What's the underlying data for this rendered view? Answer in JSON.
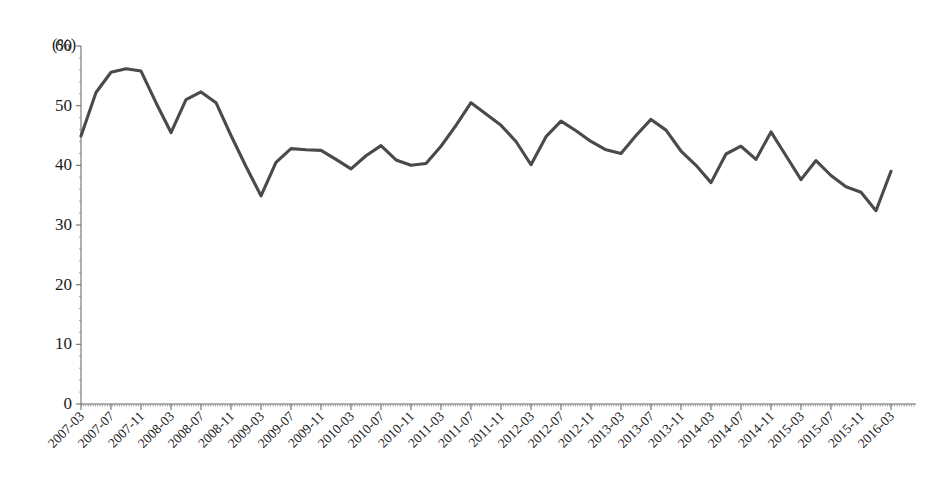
{
  "chart_data": {
    "type": "line",
    "title": "",
    "subtitle": "",
    "xlabel": "",
    "ylabel": "",
    "unit_label": "(%)",
    "grid": false,
    "legend": "none",
    "ylim": [
      0,
      60
    ],
    "ytick_values": [
      0,
      10,
      20,
      30,
      40,
      50,
      60
    ],
    "ytick_labels": [
      "0",
      "10",
      "20",
      "30",
      "40",
      "50",
      "60"
    ],
    "xtick_labels": [
      "2007-03",
      "2007-07",
      "2007-11",
      "2008-03",
      "2008-07",
      "2008-11",
      "2009-03",
      "2009-07",
      "2009-11",
      "2010-03",
      "2010-07",
      "2010-11",
      "2011-03",
      "2011-07",
      "2011-11",
      "2012-03",
      "2012-07",
      "2012-11",
      "2013-03",
      "2013-07",
      "2013-11",
      "2014-03",
      "2014-07",
      "2014-11",
      "2015-03",
      "2015-07",
      "2015-11",
      "2016-03"
    ],
    "xtick_rotation_deg": 45,
    "x_interval_months": 4,
    "series": [
      {
        "name": "ratio",
        "color": "#4a4a4a",
        "x": [
          "2007-03",
          "2007-05",
          "2007-07",
          "2007-09",
          "2007-11",
          "2008-01",
          "2008-03",
          "2008-05",
          "2008-07",
          "2008-09",
          "2008-11",
          "2009-01",
          "2009-03",
          "2009-05",
          "2009-07",
          "2009-09",
          "2009-11",
          "2010-01",
          "2010-03",
          "2010-05",
          "2010-07",
          "2010-09",
          "2010-11",
          "2011-01",
          "2011-03",
          "2011-05",
          "2011-07",
          "2011-09",
          "2011-11",
          "2012-01",
          "2012-03",
          "2012-05",
          "2012-07",
          "2012-09",
          "2012-11",
          "2013-01",
          "2013-03",
          "2013-05",
          "2013-07",
          "2013-09",
          "2013-11",
          "2014-01",
          "2014-03",
          "2014-05",
          "2014-07",
          "2014-09",
          "2014-11",
          "2015-01",
          "2015-03",
          "2015-05",
          "2015-07",
          "2015-09",
          "2015-11",
          "2016-01",
          "2016-03"
        ],
        "values": [
          44.9,
          52.2,
          55.6,
          56.2,
          55.8,
          50.5,
          45.5,
          51.0,
          52.3,
          50.5,
          45.0,
          39.8,
          34.9,
          40.5,
          42.8,
          42.6,
          42.5,
          41.0,
          39.4,
          41.6,
          43.3,
          40.9,
          40.0,
          40.3,
          43.2,
          46.7,
          50.5,
          48.6,
          46.7,
          44.0,
          40.1,
          44.8,
          47.4,
          45.8,
          44.0,
          42.6,
          42.0,
          45.0,
          47.7,
          45.9,
          42.4,
          40.0,
          37.1,
          41.9,
          43.2,
          41.0,
          45.6,
          41.6,
          37.6,
          40.8,
          38.3,
          36.4,
          35.5,
          32.4,
          39.0
        ]
      }
    ]
  }
}
